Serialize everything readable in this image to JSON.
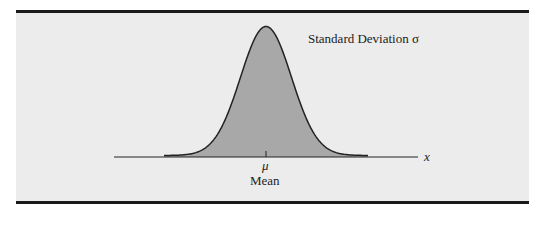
{
  "figure": {
    "annotation_sd": "Standard Deviation σ",
    "mean_symbol": "μ",
    "mean_label": "Mean",
    "axis_label": "x",
    "colors": {
      "background": "#ececec",
      "fill": "#a8a8a8",
      "stroke": "#222222",
      "border": "#1a1a1a"
    }
  },
  "chart_data": {
    "type": "area",
    "xlabel": "x",
    "ylabel": "",
    "annotations": [
      "Standard Deviation σ",
      "μ",
      "Mean"
    ],
    "distribution": {
      "name": "normal",
      "mean": 0,
      "sd": 1,
      "x_range_sd": [
        -4,
        4
      ]
    },
    "grid": false,
    "legend": "none"
  }
}
